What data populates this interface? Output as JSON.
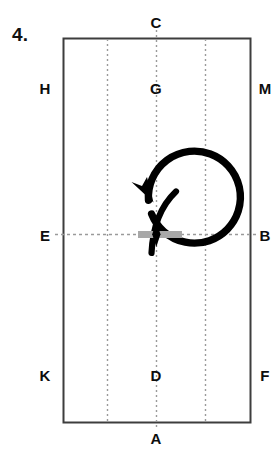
{
  "figure": {
    "number_label": "4.",
    "frame": {
      "x": 63,
      "y": 38,
      "width": 187,
      "height": 384,
      "stroke_color": "#3d3d3d",
      "fill_color": "#ffffff"
    },
    "guides": {
      "stroke_color": "#9a9a9a",
      "vertical_x": [
        107,
        156,
        205
      ],
      "horizontal_y": [
        234
      ]
    },
    "points": [
      {
        "id": "C",
        "label": "C",
        "x": 156,
        "y": 22,
        "position": "top-outside"
      },
      {
        "id": "H",
        "label": "H",
        "x": 45,
        "y": 88,
        "position": "left-outside"
      },
      {
        "id": "G",
        "label": "G",
        "x": 156,
        "y": 88,
        "position": "inside-upper-center"
      },
      {
        "id": "M",
        "label": "M",
        "x": 265,
        "y": 88,
        "position": "right-outside"
      },
      {
        "id": "E",
        "label": "E",
        "x": 45,
        "y": 235,
        "position": "left-outside"
      },
      {
        "id": "B",
        "label": "B",
        "x": 265,
        "y": 235,
        "position": "right-outside"
      },
      {
        "id": "K",
        "label": "K",
        "x": 45,
        "y": 375,
        "position": "left-outside"
      },
      {
        "id": "D",
        "label": "D",
        "x": 156,
        "y": 375,
        "position": "inside-lower-center"
      },
      {
        "id": "F",
        "label": "F",
        "x": 265,
        "y": 375,
        "position": "right-outside"
      },
      {
        "id": "A",
        "label": "A",
        "x": 156,
        "y": 438,
        "position": "bottom-outside"
      }
    ],
    "rotation_arrow": {
      "name": "clockwise-circular-arrow",
      "center_x": 120,
      "center_y": 234,
      "radius": 46,
      "stroke_color": "#000000",
      "stroke_width": 7,
      "direction": "clockwise"
    },
    "bar": {
      "name": "horizontal-gray-bar",
      "x": 138,
      "y": 231,
      "width": 44,
      "height": 7,
      "color": "#a8a8a8"
    },
    "marker": {
      "name": "black-pivot-marker",
      "x": 156,
      "y": 234,
      "color": "#000000"
    },
    "curve": {
      "name": "curved-stroke",
      "stroke_color": "#000000",
      "stroke_width": 6,
      "start_x": 152,
      "start_y": 252,
      "end_x": 176,
      "end_y": 191
    }
  }
}
